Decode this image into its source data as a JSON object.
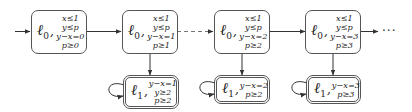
{
  "diagram": {
    "type": "state-transition-chain",
    "top_row": [
      {
        "location": "ℓ",
        "index": "0",
        "constraints": [
          "x≤1",
          "y≤p",
          "y−x=0",
          "p≥0"
        ]
      },
      {
        "location": "ℓ",
        "index": "0",
        "constraints": [
          "x≤1",
          "y≤p",
          "y−x=1",
          "p≥1"
        ]
      },
      {
        "location": "ℓ",
        "index": "0",
        "constraints": [
          "x≤1",
          "y≤p",
          "y−x=2",
          "p≥2"
        ]
      },
      {
        "location": "ℓ",
        "index": "0",
        "constraints": [
          "x≤1",
          "y≤p",
          "y−x=3",
          "p≥3"
        ]
      }
    ],
    "bottom_row": [
      {
        "location": "ℓ",
        "index": "1",
        "constraints": [
          "y−x=1",
          "y≥2",
          "p≥2"
        ],
        "self_loop": true
      },
      {
        "location": "ℓ",
        "index": "1",
        "constraints": [
          "y−x=2",
          "p≥2"
        ],
        "self_loop": true
      },
      {
        "location": "ℓ",
        "index": "1",
        "constraints": [
          "y−x=3",
          "p≥3"
        ],
        "self_loop": true
      }
    ],
    "edges": [
      {
        "from": "initial",
        "to": "top-0",
        "style": "solid"
      },
      {
        "from": "top-0",
        "to": "top-1",
        "style": "solid"
      },
      {
        "from": "top-1",
        "to": "top-2",
        "style": "dashed"
      },
      {
        "from": "top-2",
        "to": "top-3",
        "style": "solid"
      },
      {
        "from": "top-3",
        "to": "continuation",
        "style": "solid"
      },
      {
        "from": "top-1",
        "to": "bottom-0",
        "style": "solid"
      },
      {
        "from": "top-2",
        "to": "bottom-1",
        "style": "solid"
      },
      {
        "from": "top-3",
        "to": "bottom-2",
        "style": "solid"
      }
    ],
    "continuation": "···",
    "comma": ","
  }
}
